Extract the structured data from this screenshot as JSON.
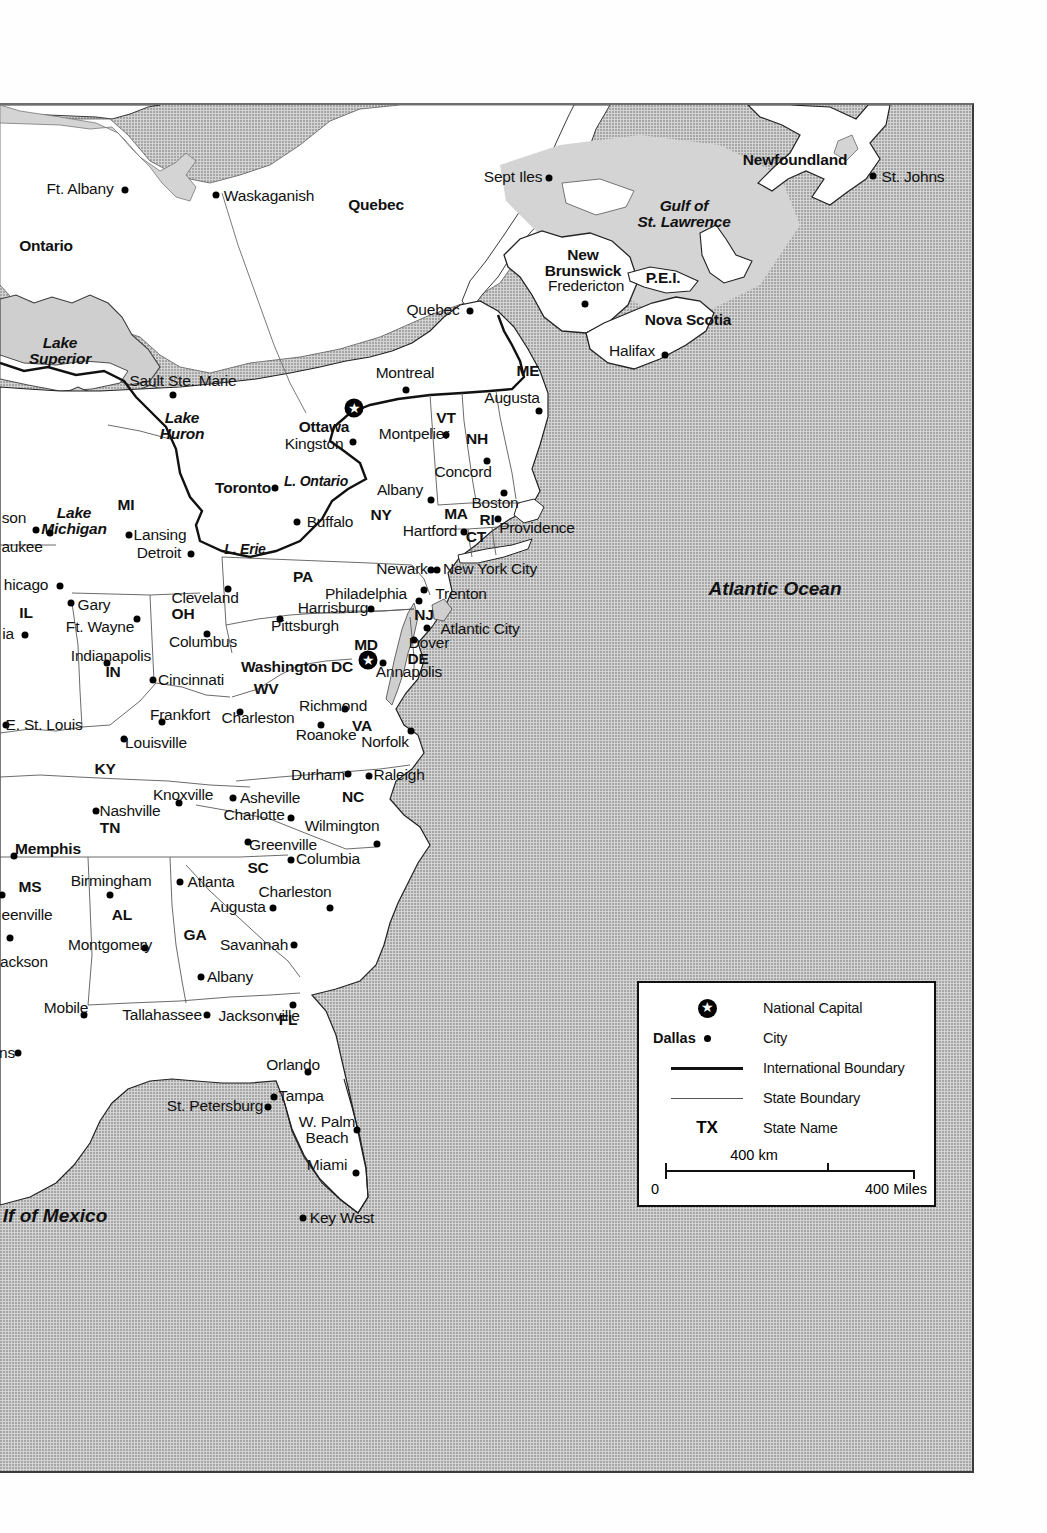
{
  "map": {
    "title": "Eastern United States and Eastern Canada Reference Map",
    "colors": {
      "ocean": "#d4d4d4",
      "land": "#ffffff",
      "lake": "#d0d0d0",
      "international_boundary": "#111111",
      "state_boundary": "#555555",
      "frame": "#333333"
    }
  },
  "legend": {
    "rows": [
      {
        "key_label": "",
        "symbol": "national-capital-star-icon",
        "text": "National Capital"
      },
      {
        "key_label": "Dallas",
        "symbol": "city-dot-icon",
        "text": "City"
      },
      {
        "key_label": "",
        "symbol": "thick-line-icon",
        "text": "International Boundary"
      },
      {
        "key_label": "",
        "symbol": "thin-line-icon",
        "text": "State Boundary"
      },
      {
        "key_label": "TX",
        "symbol": "state-abbreviation-text",
        "text": "State Name"
      }
    ],
    "scale": {
      "km_label": "400 km",
      "zero_label": "0",
      "miles_label": "400 Miles"
    }
  },
  "water_labels": [
    {
      "name": "Lake Superior",
      "text": "Lake\nSuperior",
      "x": 60,
      "y": 245,
      "size": "lg"
    },
    {
      "name": "Lake Huron",
      "text": "Lake\nHuron",
      "x": 182,
      "y": 320,
      "size": "lg"
    },
    {
      "name": "Lake Michigan",
      "text": "Lake\nMichigan",
      "x": 74,
      "y": 415,
      "size": "lg"
    },
    {
      "name": "Lake Ontario",
      "text": "L. Ontario",
      "x": 316,
      "y": 376,
      "size": "sm"
    },
    {
      "name": "Lake Erie",
      "text": "L. Erie",
      "x": 245,
      "y": 444,
      "size": "sm"
    },
    {
      "name": "Gulf of St. Lawrence",
      "text": "Gulf of\nSt. Lawrence",
      "x": 684,
      "y": 108,
      "size": "lg"
    },
    {
      "name": "Atlantic Ocean",
      "text": "Atlantic Ocean",
      "x": 775,
      "y": 483,
      "size": "ocean"
    },
    {
      "name": "Gulf of Mexico",
      "text": "lf of Mexico",
      "x": 55,
      "y": 1110,
      "size": "ocean"
    }
  ],
  "provinces": [
    {
      "name": "Ontario",
      "text": "Ontario",
      "x": 46,
      "y": 141
    },
    {
      "name": "Quebec",
      "text": "Quebec",
      "x": 376,
      "y": 100
    },
    {
      "name": "New Brunswick",
      "text": "New\nBrunswick",
      "x": 583,
      "y": 157
    },
    {
      "name": "Nova Scotia",
      "text": "Nova Scotia",
      "x": 688,
      "y": 215
    },
    {
      "name": "P.E.I.",
      "text": "P.E.I.",
      "x": 663,
      "y": 173
    },
    {
      "name": "Newfoundland",
      "text": "Newfoundland",
      "x": 795,
      "y": 55
    }
  ],
  "states": [
    {
      "abbr": "ME",
      "x": 528,
      "y": 266
    },
    {
      "abbr": "VT",
      "x": 446,
      "y": 313
    },
    {
      "abbr": "NH",
      "x": 477,
      "y": 334
    },
    {
      "abbr": "MA",
      "x": 456,
      "y": 409
    },
    {
      "abbr": "RI",
      "x": 487,
      "y": 415
    },
    {
      "abbr": "CT",
      "x": 476,
      "y": 432
    },
    {
      "abbr": "NY",
      "x": 381,
      "y": 410
    },
    {
      "abbr": "PA",
      "x": 303,
      "y": 472
    },
    {
      "abbr": "NJ",
      "x": 424,
      "y": 510
    },
    {
      "abbr": "DE",
      "x": 418,
      "y": 554
    },
    {
      "abbr": "MD",
      "x": 366,
      "y": 540
    },
    {
      "abbr": "WV",
      "x": 266,
      "y": 584
    },
    {
      "abbr": "VA",
      "x": 362,
      "y": 621
    },
    {
      "abbr": "OH",
      "x": 183,
      "y": 509
    },
    {
      "abbr": "IN",
      "x": 113,
      "y": 567
    },
    {
      "abbr": "IL",
      "x": 26,
      "y": 508
    },
    {
      "abbr": "MI",
      "x": 126,
      "y": 400
    },
    {
      "abbr": "KY",
      "x": 105,
      "y": 664
    },
    {
      "abbr": "TN",
      "x": 110,
      "y": 723
    },
    {
      "abbr": "NC",
      "x": 353,
      "y": 692
    },
    {
      "abbr": "SC",
      "x": 258,
      "y": 763
    },
    {
      "abbr": "GA",
      "x": 195,
      "y": 830
    },
    {
      "abbr": "AL",
      "x": 122,
      "y": 810
    },
    {
      "abbr": "MS",
      "x": 30,
      "y": 782
    },
    {
      "abbr": "FL",
      "x": 288,
      "y": 915
    }
  ],
  "capitals": [
    {
      "name": "Ottawa",
      "label": "Ottawa",
      "dot_x": 354,
      "dot_y": 303,
      "lbl_x": 324,
      "lbl_y": 322,
      "anchor": "center"
    },
    {
      "name": "Washington DC",
      "label": "Washington DC",
      "dot_x": 368,
      "dot_y": 555,
      "lbl_x": 297,
      "lbl_y": 562,
      "anchor": "center"
    }
  ],
  "cities": [
    {
      "name": "Ft. Albany",
      "label": "Ft. Albany",
      "dot_x": 125,
      "dot_y": 85,
      "lbl_x": 80,
      "lbl_y": 84,
      "bold": false
    },
    {
      "name": "Waskaganish",
      "label": "Waskaganish",
      "dot_x": 216,
      "dot_y": 90,
      "lbl_x": 269,
      "lbl_y": 91,
      "bold": false
    },
    {
      "name": "Sept Iles",
      "label": "Sept Iles",
      "dot_x": 549,
      "dot_y": 73,
      "lbl_x": 513,
      "lbl_y": 72,
      "bold": false
    },
    {
      "name": "St. Johns",
      "label": "St. Johns",
      "dot_x": 873,
      "dot_y": 71,
      "lbl_x": 913,
      "lbl_y": 72,
      "bold": false
    },
    {
      "name": "Quebec City",
      "label": "Quebec",
      "dot_x": 470,
      "dot_y": 206,
      "lbl_x": 433,
      "lbl_y": 205,
      "bold": false
    },
    {
      "name": "Fredericton",
      "label": "Fredericton",
      "dot_x": 585,
      "dot_y": 199,
      "lbl_x": 586,
      "lbl_y": 181,
      "bold": false
    },
    {
      "name": "Halifax",
      "label": "Halifax",
      "dot_x": 665,
      "dot_y": 250,
      "lbl_x": 632,
      "lbl_y": 246,
      "bold": false
    },
    {
      "name": "Sault Ste. Marie",
      "label": "Sault Ste. Marie",
      "dot_x": 173,
      "dot_y": 290,
      "lbl_x": 183,
      "lbl_y": 276,
      "bold": false
    },
    {
      "name": "Montreal",
      "label": "Montreal",
      "dot_x": 406,
      "dot_y": 285,
      "lbl_x": 405,
      "lbl_y": 268,
      "bold": false
    },
    {
      "name": "Kingston",
      "label": "Kingston",
      "dot_x": 353,
      "dot_y": 337,
      "lbl_x": 314,
      "lbl_y": 339,
      "bold": false
    },
    {
      "name": "Toronto",
      "label": "Toronto",
      "dot_x": 275,
      "dot_y": 383,
      "lbl_x": 243,
      "lbl_y": 383,
      "bold": true
    },
    {
      "name": "Augusta",
      "label": "Augusta",
      "dot_x": 539,
      "dot_y": 306,
      "lbl_x": 512,
      "lbl_y": 293,
      "bold": false
    },
    {
      "name": "Montpelier",
      "label": "Montpelier",
      "dot_x": 446,
      "dot_y": 330,
      "lbl_x": 414,
      "lbl_y": 329,
      "bold": false
    },
    {
      "name": "Concord",
      "label": "Concord",
      "dot_x": 487,
      "dot_y": 356,
      "lbl_x": 463,
      "lbl_y": 367,
      "bold": false
    },
    {
      "name": "Albany",
      "label": "Albany",
      "dot_x": 431,
      "dot_y": 395,
      "lbl_x": 400,
      "lbl_y": 385,
      "bold": false
    },
    {
      "name": "Boston",
      "label": "Boston",
      "dot_x": 504,
      "dot_y": 388,
      "lbl_x": 495,
      "lbl_y": 398,
      "bold": false
    },
    {
      "name": "Buffalo",
      "label": "Buffalo",
      "dot_x": 297,
      "dot_y": 417,
      "lbl_x": 330,
      "lbl_y": 417,
      "bold": false
    },
    {
      "name": "Hartford",
      "label": "Hartford",
      "dot_x": 464,
      "dot_y": 427,
      "lbl_x": 430,
      "lbl_y": 426,
      "bold": false
    },
    {
      "name": "Providence",
      "label": "Providence",
      "dot_x": 498,
      "dot_y": 414,
      "lbl_x": 537,
      "lbl_y": 423,
      "bold": false
    },
    {
      "name": "Lansing",
      "label": "Lansing",
      "dot_x": 129,
      "dot_y": 430,
      "lbl_x": 160,
      "lbl_y": 430,
      "bold": false
    },
    {
      "name": "Detroit",
      "label": "Detroit",
      "dot_x": 191,
      "dot_y": 449,
      "lbl_x": 159,
      "lbl_y": 448,
      "bold": false
    },
    {
      "name": "Madison",
      "label": "son",
      "dot_x": 36,
      "dot_y": 425,
      "lbl_x": 14,
      "lbl_y": 413,
      "bold": false
    },
    {
      "name": "Milwaukee",
      "label": "aukee",
      "dot_x": 50,
      "dot_y": 428,
      "lbl_x": 22,
      "lbl_y": 442,
      "bold": false
    },
    {
      "name": "Chicago",
      "label": "hicago",
      "dot_x": 60,
      "dot_y": 481,
      "lbl_x": 26,
      "lbl_y": 480,
      "bold": false
    },
    {
      "name": "Gary",
      "label": "Gary",
      "dot_x": 71,
      "dot_y": 498,
      "lbl_x": 94,
      "lbl_y": 500,
      "bold": false
    },
    {
      "name": "Cleveland",
      "label": "Cleveland",
      "dot_x": 228,
      "dot_y": 484,
      "lbl_x": 205,
      "lbl_y": 493,
      "bold": false
    },
    {
      "name": "Ft. Wayne",
      "label": "Ft. Wayne",
      "dot_x": 137,
      "dot_y": 514,
      "lbl_x": 100,
      "lbl_y": 522,
      "bold": false
    },
    {
      "name": "Columbus",
      "label": "Columbus",
      "dot_x": 207,
      "dot_y": 529,
      "lbl_x": 203,
      "lbl_y": 537,
      "bold": false
    },
    {
      "name": "Peoria",
      "label": "ia",
      "dot_x": 25,
      "dot_y": 530,
      "lbl_x": 8,
      "lbl_y": 529,
      "bold": false
    },
    {
      "name": "Indianapolis",
      "label": "Indianapolis",
      "dot_x": 107,
      "dot_y": 558,
      "lbl_x": 111,
      "lbl_y": 551,
      "bold": false
    },
    {
      "name": "Harrisburg",
      "label": "Harrisburg",
      "dot_x": 371,
      "dot_y": 504,
      "lbl_x": 333,
      "lbl_y": 503,
      "bold": false
    },
    {
      "name": "Pittsburgh",
      "label": "Pittsburgh",
      "dot_x": 280,
      "dot_y": 514,
      "lbl_x": 305,
      "lbl_y": 521,
      "bold": false
    },
    {
      "name": "Philadelphia",
      "label": "Philadelphia",
      "dot_x": 419,
      "dot_y": 496,
      "lbl_x": 366,
      "lbl_y": 489,
      "bold": false
    },
    {
      "name": "Trenton",
      "label": "Trenton",
      "dot_x": 424,
      "dot_y": 485,
      "lbl_x": 461,
      "lbl_y": 489,
      "bold": false
    },
    {
      "name": "Newark",
      "label": "Newark",
      "dot_x": 431,
      "dot_y": 465,
      "lbl_x": 402,
      "lbl_y": 464,
      "bold": false
    },
    {
      "name": "New York City",
      "label": "New York City",
      "dot_x": 437,
      "dot_y": 465,
      "lbl_x": 490,
      "lbl_y": 464,
      "bold": false
    },
    {
      "name": "Atlantic City",
      "label": "Atlantic City",
      "dot_x": 427,
      "dot_y": 523,
      "lbl_x": 480,
      "lbl_y": 524,
      "bold": false
    },
    {
      "name": "Dover",
      "label": "Dover",
      "dot_x": 414,
      "dot_y": 535,
      "lbl_x": 429,
      "lbl_y": 538,
      "bold": false
    },
    {
      "name": "Annapolis",
      "label": "Annapolis",
      "dot_x": 383,
      "dot_y": 558,
      "lbl_x": 409,
      "lbl_y": 567,
      "bold": false
    },
    {
      "name": "Cincinnati",
      "label": "Cincinnati",
      "dot_x": 153,
      "dot_y": 575,
      "lbl_x": 191,
      "lbl_y": 575,
      "bold": false
    },
    {
      "name": "Frankfort",
      "label": "Frankfort",
      "dot_x": 162,
      "dot_y": 617,
      "lbl_x": 180,
      "lbl_y": 610,
      "bold": false
    },
    {
      "name": "Charleston WV",
      "label": "Charleston",
      "dot_x": 240,
      "dot_y": 607,
      "lbl_x": 258,
      "lbl_y": 613,
      "bold": false
    },
    {
      "name": "Louisville",
      "label": "Louisville",
      "dot_x": 124,
      "dot_y": 634,
      "lbl_x": 156,
      "lbl_y": 638,
      "bold": false
    },
    {
      "name": "E. St. Louis",
      "label": "E. St. Louis",
      "dot_x": 6,
      "dot_y": 620,
      "lbl_x": 44,
      "lbl_y": 620,
      "bold": false
    },
    {
      "name": "Richmond",
      "label": "Richmond",
      "dot_x": 345,
      "dot_y": 604,
      "lbl_x": 333,
      "lbl_y": 601,
      "bold": false
    },
    {
      "name": "Roanoke",
      "label": "Roanoke",
      "dot_x": 321,
      "dot_y": 620,
      "lbl_x": 326,
      "lbl_y": 630,
      "bold": false
    },
    {
      "name": "Norfolk",
      "label": "Norfolk",
      "dot_x": 411,
      "dot_y": 626,
      "lbl_x": 385,
      "lbl_y": 637,
      "bold": false
    },
    {
      "name": "Durham",
      "label": "Durham",
      "dot_x": 348,
      "dot_y": 669,
      "lbl_x": 318,
      "lbl_y": 670,
      "bold": false
    },
    {
      "name": "Raleigh",
      "label": "Raleigh",
      "dot_x": 369,
      "dot_y": 671,
      "lbl_x": 399,
      "lbl_y": 670,
      "bold": false
    },
    {
      "name": "Knoxville",
      "label": "Knoxville",
      "dot_x": 179,
      "dot_y": 698,
      "lbl_x": 183,
      "lbl_y": 690,
      "bold": false
    },
    {
      "name": "Asheville",
      "label": "Asheville",
      "dot_x": 233,
      "dot_y": 693,
      "lbl_x": 270,
      "lbl_y": 693,
      "bold": false
    },
    {
      "name": "Nashville",
      "label": "Nashville",
      "dot_x": 96,
      "dot_y": 706,
      "lbl_x": 130,
      "lbl_y": 706,
      "bold": false
    },
    {
      "name": "Charlotte",
      "label": "Charlotte",
      "dot_x": 291,
      "dot_y": 713,
      "lbl_x": 254,
      "lbl_y": 710,
      "bold": false
    },
    {
      "name": "Wilmington NC",
      "label": "Wilmington",
      "dot_x": 377,
      "dot_y": 739,
      "lbl_x": 342,
      "lbl_y": 721,
      "bold": false
    },
    {
      "name": "Greenville SC",
      "label": "Greenville",
      "dot_x": 248,
      "dot_y": 737,
      "lbl_x": 283,
      "lbl_y": 740,
      "bold": false
    },
    {
      "name": "Memphis",
      "label": "Memphis",
      "dot_x": 14,
      "dot_y": 751,
      "lbl_x": 48,
      "lbl_y": 744,
      "bold": true
    },
    {
      "name": "Columbia",
      "label": "Columbia",
      "dot_x": 291,
      "dot_y": 755,
      "lbl_x": 328,
      "lbl_y": 754,
      "bold": false
    },
    {
      "name": "Atlanta",
      "label": "Atlanta",
      "dot_x": 180,
      "dot_y": 777,
      "lbl_x": 211,
      "lbl_y": 777,
      "bold": false
    },
    {
      "name": "Birmingham",
      "label": "Birmingham",
      "dot_x": 110,
      "dot_y": 790,
      "lbl_x": 111,
      "lbl_y": 776,
      "bold": false
    },
    {
      "name": "Charleston SC",
      "label": "Charleston",
      "dot_x": 330,
      "dot_y": 803,
      "lbl_x": 295,
      "lbl_y": 787,
      "bold": false
    },
    {
      "name": "Greenville MS",
      "label": "eenville",
      "dot_x": 2,
      "dot_y": 790,
      "lbl_x": 27,
      "lbl_y": 810,
      "bold": false
    },
    {
      "name": "Augusta GA",
      "label": "Augusta",
      "dot_x": 273,
      "dot_y": 803,
      "lbl_x": 238,
      "lbl_y": 802,
      "bold": false
    },
    {
      "name": "Savannah",
      "label": "Savannah",
      "dot_x": 294,
      "dot_y": 840,
      "lbl_x": 254,
      "lbl_y": 840,
      "bold": false
    },
    {
      "name": "Montgomery",
      "label": "Montgomery",
      "dot_x": 145,
      "dot_y": 843,
      "lbl_x": 110,
      "lbl_y": 840,
      "bold": false
    },
    {
      "name": "Jackson",
      "label": "ackson",
      "dot_x": 10,
      "dot_y": 833,
      "lbl_x": 24,
      "lbl_y": 857,
      "bold": false
    },
    {
      "name": "Albany GA",
      "label": "Albany",
      "dot_x": 201,
      "dot_y": 872,
      "lbl_x": 230,
      "lbl_y": 872,
      "bold": false
    },
    {
      "name": "Mobile",
      "label": "Mobile",
      "dot_x": 84,
      "dot_y": 910,
      "lbl_x": 66,
      "lbl_y": 903,
      "bold": false
    },
    {
      "name": "New Orleans",
      "label": "ns",
      "dot_x": 18,
      "dot_y": 948,
      "lbl_x": 7,
      "lbl_y": 948,
      "bold": false
    },
    {
      "name": "Tallahassee",
      "label": "Tallahassee",
      "dot_x": 207,
      "dot_y": 910,
      "lbl_x": 162,
      "lbl_y": 910,
      "bold": false
    },
    {
      "name": "Jacksonville",
      "label": "Jacksonville",
      "dot_x": 293,
      "dot_y": 900,
      "lbl_x": 259,
      "lbl_y": 911,
      "bold": false
    },
    {
      "name": "Orlando",
      "label": "Orlando",
      "dot_x": 308,
      "dot_y": 967,
      "lbl_x": 293,
      "lbl_y": 960,
      "bold": false
    },
    {
      "name": "Tampa",
      "label": "Tampa",
      "dot_x": 274,
      "dot_y": 992,
      "lbl_x": 301,
      "lbl_y": 991,
      "bold": false
    },
    {
      "name": "St. Petersburg",
      "label": "St. Petersburg",
      "dot_x": 268,
      "dot_y": 1002,
      "lbl_x": 215,
      "lbl_y": 1001,
      "bold": false
    },
    {
      "name": "W. Palm Beach",
      "label": "W. Palm\nBeach",
      "dot_x": 357,
      "dot_y": 1025,
      "lbl_x": 327,
      "lbl_y": 1024,
      "bold": false
    },
    {
      "name": "Miami",
      "label": "Miami",
      "dot_x": 356,
      "dot_y": 1068,
      "lbl_x": 327,
      "lbl_y": 1060,
      "bold": false
    },
    {
      "name": "Key West",
      "label": "Key West",
      "dot_x": 303,
      "dot_y": 1113,
      "lbl_x": 342,
      "lbl_y": 1113,
      "bold": false
    }
  ]
}
